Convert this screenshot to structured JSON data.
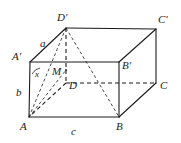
{
  "figure": {
    "kind": "rectangular-prism-diagram",
    "width": 181,
    "height": 143,
    "background": "#ffffff",
    "stroke_color": "#1a1a1a",
    "stroke_width": 1.1,
    "dash_pattern": "4 3",
    "thin_dash_pattern": "3 2.5"
  },
  "vertices": [
    {
      "id": "A",
      "label": "A",
      "x": 29,
      "y": 117,
      "label_x": 20,
      "label_y": 121
    },
    {
      "id": "B",
      "label": "B",
      "x": 119,
      "y": 117,
      "label_x": 116,
      "label_y": 121
    },
    {
      "id": "C",
      "label": "C",
      "x": 156,
      "y": 83,
      "label_x": 160,
      "label_y": 80
    },
    {
      "id": "D",
      "label": "D",
      "x": 66,
      "y": 83,
      "label_x": 69,
      "label_y": 80
    },
    {
      "id": "Aprime",
      "label": "A'",
      "x": 30,
      "y": 62,
      "label_x": 12,
      "label_y": 51
    },
    {
      "id": "Bprime",
      "label": "B'",
      "x": 119,
      "y": 62,
      "label_x": 122,
      "label_y": 60
    },
    {
      "id": "Cprime",
      "label": "C'",
      "x": 156,
      "y": 29,
      "label_x": 158,
      "label_y": 14
    },
    {
      "id": "Dprime",
      "label": "D'",
      "x": 66,
      "y": 28,
      "label_x": 57,
      "label_y": 12
    },
    {
      "id": "M",
      "label": "M",
      "x": 66,
      "y": 70,
      "label_x": 52,
      "label_y": 66
    }
  ],
  "edge_labels": [
    {
      "id": "a",
      "label": "a",
      "edge": "A'D'",
      "x": 40,
      "y": 38
    },
    {
      "id": "b",
      "label": "b",
      "edge": "A'A",
      "x": 16,
      "y": 87
    },
    {
      "id": "c",
      "label": "c",
      "edge": "AB",
      "x": 71,
      "y": 126
    }
  ],
  "angle_labels": [
    {
      "id": "x",
      "label": "x",
      "at_vertex": "A'",
      "x": 35,
      "y": 70
    }
  ],
  "solid_edges": [
    {
      "from": "A",
      "to": "B"
    },
    {
      "from": "B",
      "to": "Bprime"
    },
    {
      "from": "Bprime",
      "to": "Aprime"
    },
    {
      "from": "Aprime",
      "to": "A"
    },
    {
      "from": "Aprime",
      "to": "Dprime"
    },
    {
      "from": "Dprime",
      "to": "Cprime"
    },
    {
      "from": "Cprime",
      "to": "C"
    },
    {
      "from": "C",
      "to": "B"
    },
    {
      "from": "Bprime",
      "to": "Cprime"
    }
  ],
  "dashed_edges": [
    {
      "from": "Dprime",
      "to": "D"
    },
    {
      "from": "D",
      "to": "A"
    },
    {
      "from": "D",
      "to": "C"
    }
  ],
  "construction_lines": [
    {
      "from": "A",
      "to": "Dprime",
      "style": "dashed-thin"
    },
    {
      "from": "Dprime",
      "to": "B",
      "style": "dashed-thin"
    },
    {
      "from": "A",
      "to": "Bprime",
      "style": "dashed-thin"
    }
  ]
}
